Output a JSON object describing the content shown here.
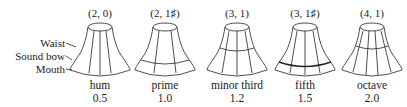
{
  "figure": {
    "part_labels": [
      "Waist",
      "Sound bow",
      "Mouth"
    ],
    "bells": [
      {
        "mode": "(2, 0)",
        "name": "hum",
        "ratio": "0.5",
        "nodal_circles": 0
      },
      {
        "mode": "(2, 1♯)",
        "name": "prime",
        "ratio": "1.0",
        "nodal_circles": 1
      },
      {
        "mode": "(3, 1)",
        "name": "minor third",
        "ratio": "1.2",
        "nodal_circles": 1
      },
      {
        "mode": "(3, 1♯)",
        "name": "fifth",
        "ratio": "1.5",
        "nodal_circles": 1
      },
      {
        "mode": "(4, 1)",
        "name": "octave",
        "ratio": "2.0",
        "nodal_circles": 1
      }
    ]
  }
}
